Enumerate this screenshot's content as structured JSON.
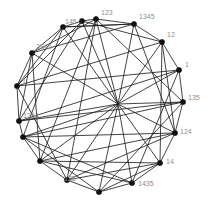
{
  "figure": {
    "type": "graph-diagram",
    "background_color": "#ffffff",
    "node_color": "#111111",
    "edge_color": "#1d1d1d",
    "label_color": "#8e8e8e",
    "center": {
      "x": 110,
      "y": 105
    },
    "radius": 88,
    "node_count": 18,
    "hub": {
      "x": 118,
      "y": 104
    }
  },
  "chart_data": {
    "type": "scatter",
    "title": "",
    "xlabel": "",
    "ylabel": "",
    "nodes": [
      {
        "id": 0,
        "label": "123",
        "x": 96,
        "y": 19,
        "label_x": 101,
        "label_y": 9,
        "label_visible": true
      },
      {
        "id": 1,
        "label": "1345",
        "x": 134,
        "y": 24,
        "label_x": 139,
        "label_y": 13,
        "label_visible": true
      },
      {
        "id": 2,
        "label": "12",
        "x": 162,
        "y": 42,
        "label_x": 167,
        "label_y": 31,
        "label_visible": true
      },
      {
        "id": 3,
        "label": "1",
        "x": 179,
        "y": 70,
        "label_x": 185,
        "label_y": 61,
        "label_visible": true
      },
      {
        "id": 4,
        "label": "135",
        "x": 183,
        "y": 102,
        "label_x": 188,
        "label_y": 94,
        "label_visible": true
      },
      {
        "id": 5,
        "label": "124",
        "x": 175,
        "y": 133,
        "label_x": 180,
        "label_y": 128,
        "label_visible": true
      },
      {
        "id": 6,
        "label": "14",
        "x": 160,
        "y": 163,
        "label_x": 166,
        "label_y": 158,
        "label_visible": true
      },
      {
        "id": 7,
        "label": "1435",
        "x": 132,
        "y": 183,
        "label_x": 138,
        "label_y": 180,
        "label_visible": true
      },
      {
        "id": 8,
        "label": "",
        "x": 99,
        "y": 192,
        "label_x": 100,
        "label_y": 182,
        "label_visible": false
      },
      {
        "id": 9,
        "label": "125",
        "x": 67,
        "y": 180,
        "label_x": 64,
        "label_y": 175,
        "label_visible": true
      },
      {
        "id": 10,
        "label": "",
        "x": 40,
        "y": 161,
        "label_x": 36,
        "label_y": 152,
        "label_visible": false
      },
      {
        "id": 11,
        "label": "",
        "x": 23,
        "y": 137,
        "label_x": 20,
        "label_y": 146,
        "label_visible": false
      },
      {
        "id": 12,
        "label": "1234",
        "x": 19,
        "y": 121,
        "label_x": 23,
        "label_y": 112,
        "label_visible": true
      },
      {
        "id": 13,
        "label": "1",
        "x": 17,
        "y": 86,
        "label_x": 22,
        "label_y": 78,
        "label_visible": true
      },
      {
        "id": 14,
        "label": "2345",
        "x": 32,
        "y": 53,
        "label_x": 36,
        "label_y": 43,
        "label_visible": true
      },
      {
        "id": 15,
        "label": "145",
        "x": 63,
        "y": 27,
        "label_x": 65,
        "label_y": 18,
        "label_visible": true
      },
      {
        "id": 16,
        "label": "",
        "x": 82,
        "y": 21,
        "label_x": 82,
        "label_y": 12,
        "label_visible": false
      },
      {
        "id": 17,
        "label": "",
        "x": 118,
        "y": 104,
        "label_x": 118,
        "label_y": 96,
        "label_visible": false
      }
    ],
    "edges": [
      [
        0,
        1
      ],
      [
        1,
        2
      ],
      [
        2,
        3
      ],
      [
        3,
        4
      ],
      [
        4,
        5
      ],
      [
        5,
        6
      ],
      [
        6,
        7
      ],
      [
        7,
        8
      ],
      [
        8,
        9
      ],
      [
        9,
        10
      ],
      [
        10,
        11
      ],
      [
        11,
        12
      ],
      [
        12,
        13
      ],
      [
        13,
        14
      ],
      [
        14,
        15
      ],
      [
        15,
        16
      ],
      [
        16,
        0
      ],
      [
        0,
        17
      ],
      [
        1,
        17
      ],
      [
        2,
        17
      ],
      [
        3,
        17
      ],
      [
        4,
        17
      ],
      [
        5,
        17
      ],
      [
        6,
        17
      ],
      [
        7,
        17
      ],
      [
        8,
        17
      ],
      [
        9,
        17
      ],
      [
        10,
        17
      ],
      [
        11,
        17
      ],
      [
        12,
        17
      ],
      [
        14,
        17
      ],
      [
        15,
        17
      ],
      [
        16,
        17
      ],
      [
        0,
        4
      ],
      [
        0,
        9
      ],
      [
        0,
        10
      ],
      [
        1,
        5
      ],
      [
        1,
        14
      ],
      [
        1,
        15
      ],
      [
        2,
        5
      ],
      [
        2,
        13
      ],
      [
        2,
        16
      ],
      [
        3,
        12
      ],
      [
        3,
        13
      ],
      [
        4,
        11
      ],
      [
        4,
        12
      ],
      [
        5,
        10
      ],
      [
        5,
        9
      ],
      [
        6,
        9
      ],
      [
        6,
        10
      ],
      [
        6,
        8
      ],
      [
        7,
        10
      ],
      [
        7,
        11
      ],
      [
        8,
        11
      ],
      [
        9,
        13
      ],
      [
        10,
        14
      ],
      [
        11,
        15
      ],
      [
        12,
        16
      ],
      [
        13,
        16
      ],
      [
        14,
        0
      ],
      [
        15,
        1
      ],
      [
        2,
        6
      ],
      [
        3,
        7
      ],
      [
        4,
        8
      ],
      [
        5,
        11
      ],
      [
        13,
        15
      ],
      [
        12,
        14
      ]
    ],
    "grid": false,
    "legend": null
  }
}
